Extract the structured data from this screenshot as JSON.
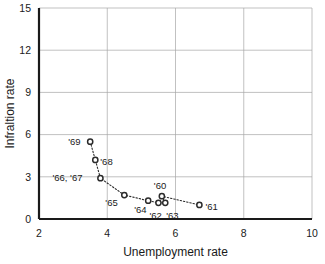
{
  "chart_data": {
    "type": "scatter",
    "title": "",
    "xlabel": "Unemployment rate",
    "ylabel": "Infraltion rate",
    "xlim": [
      2,
      10
    ],
    "ylim": [
      0,
      15
    ],
    "xticks": [
      2,
      4,
      6,
      8,
      10
    ],
    "yticks": [
      0,
      3,
      6,
      9,
      12,
      15
    ],
    "grid": true,
    "legend": "none",
    "connected": true,
    "line_style": "dotted",
    "marker": "open-circle",
    "points": [
      {
        "label": "'69",
        "x": 3.5,
        "y": 5.5,
        "label_dx": -22,
        "label_dy": 3
      },
      {
        "label": "'68",
        "x": 3.65,
        "y": 4.2,
        "label_dx": 5,
        "label_dy": 5
      },
      {
        "label": "'66, '67",
        "x": 3.8,
        "y": 2.9,
        "label_dx": -48,
        "label_dy": 3
      },
      {
        "label": "'65",
        "x": 4.5,
        "y": 1.7,
        "label_dx": -19,
        "label_dy": 11
      },
      {
        "label": "'64",
        "x": 5.2,
        "y": 1.3,
        "label_dx": -14,
        "label_dy": 12
      },
      {
        "label": "'62",
        "x": 5.5,
        "y": 1.15,
        "label_dx": -9,
        "label_dy": 16
      },
      {
        "label": "'63",
        "x": 5.7,
        "y": 1.15,
        "label_dx": 1,
        "label_dy": 16
      },
      {
        "label": "'60",
        "x": 5.6,
        "y": 1.62,
        "label_dx": -8,
        "label_dy": -7
      },
      {
        "label": "'61",
        "x": 6.7,
        "y": 1.0,
        "label_dx": 6,
        "label_dy": 5
      }
    ],
    "series_order": [
      "'69",
      "'68",
      "'66, '67",
      "'65",
      "'64",
      "'62",
      "'63",
      "'60",
      "'61"
    ],
    "colors": {
      "marker_stroke": "#2b2b2b",
      "marker_fill": "#ffffff",
      "line": "#2b2b2b",
      "grid": "#a6a6a6",
      "axis": "#1a1a1a",
      "background": "#ffffff"
    }
  }
}
